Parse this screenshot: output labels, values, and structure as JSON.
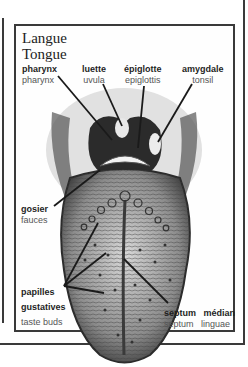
{
  "title": {
    "french": "Langue",
    "english": "Tongue"
  },
  "labels": {
    "pharynx": {
      "french": "pharynx",
      "english": "pharynx"
    },
    "uvula": {
      "french": "luette",
      "english": "uvula"
    },
    "epiglottis": {
      "french": "épiglotte",
      "english": "epiglottis"
    },
    "tonsil": {
      "french": "amygdale",
      "english": "tonsil"
    },
    "fauces": {
      "french": "gosier",
      "english": "fauces"
    },
    "taste_buds": {
      "french_line1": "papilles",
      "french_line2": "gustatives",
      "english_word1": "taste",
      "english_word2": "buds"
    },
    "septum": {
      "french_word1": "septum",
      "french_word2": "médian",
      "english_word1": "septum",
      "english_word2": "linguae"
    }
  },
  "colors": {
    "frame": "#3a3a3a",
    "label_bold": "#1e1e1e",
    "label_light": "#555555",
    "illustration_dark": "#2b2b2b",
    "illustration_mid": "#8a8a8a"
  }
}
